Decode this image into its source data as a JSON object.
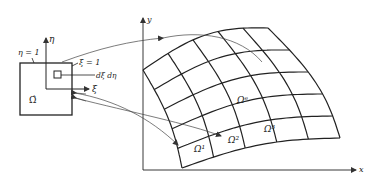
{
  "reference_element": {
    "symbol": "Ω̂",
    "eta_axis_label": "η",
    "xi_axis_label": "ξ",
    "eta_boundary_label": "η = 1",
    "xi_boundary_label": "ξ = 1",
    "differential_label": "dξ dη"
  },
  "physical_domain": {
    "x_axis_label": "x",
    "y_axis_label": "y",
    "element_labels": {
      "omega_e": "Ωᵉ",
      "omega_1": "Ω¹",
      "omega_2": "Ω²",
      "omega_3": "Ω³"
    },
    "mesh": {
      "columns": 5,
      "rows": 5
    }
  },
  "colors": {
    "line": "#222222",
    "arrow": "#444444",
    "background": "#ffffff"
  }
}
